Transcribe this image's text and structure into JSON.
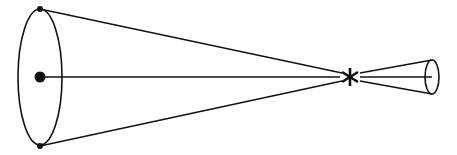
{
  "diagram": {
    "type": "cone-projection",
    "stroke_color": "#111111",
    "background_color": "#ffffff",
    "large_ellipse": {
      "cx": 40,
      "cy": 77,
      "rx": 22,
      "ry": 68
    },
    "center_dot": {
      "cx": 40,
      "cy": 77,
      "r": 5
    },
    "top_point": {
      "cx": 40,
      "cy": 9,
      "r": 3
    },
    "bottom_point": {
      "cx": 40,
      "cy": 146,
      "r": 3
    },
    "focal_point": {
      "x": 350,
      "y": 77,
      "symbol": "*"
    },
    "small_ellipse": {
      "cx": 432,
      "cy": 77,
      "rx": 7,
      "ry": 17
    },
    "axis_line": {
      "x1": 40,
      "y1": 77,
      "x2": 432,
      "y2": 77
    }
  }
}
